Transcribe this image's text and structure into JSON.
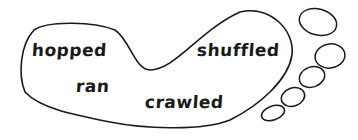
{
  "diagram": {
    "shape": "footprint",
    "stroke_color": "#1a1a1a",
    "words": [
      {
        "text": "hopped",
        "x": 32,
        "y": 40
      },
      {
        "text": "ran",
        "x": 76,
        "y": 76
      },
      {
        "text": "shuffled",
        "x": 197,
        "y": 40
      },
      {
        "text": "crawled",
        "x": 145,
        "y": 92
      }
    ],
    "toes": 5
  }
}
